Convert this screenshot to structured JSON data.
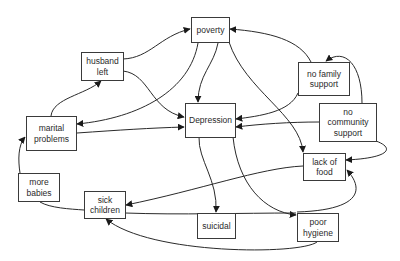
{
  "diagram": {
    "type": "causal-loop",
    "nodes": [
      {
        "id": "poverty",
        "label": "poverty"
      },
      {
        "id": "husband_left",
        "label": "husband\nleft"
      },
      {
        "id": "no_family_support",
        "label": "no family\nsupport"
      },
      {
        "id": "no_community_support",
        "label": "no\ncommunity\nsupport"
      },
      {
        "id": "marital_problems",
        "label": "marital\nproblems"
      },
      {
        "id": "depression",
        "label": "Depression"
      },
      {
        "id": "lack_of_food",
        "label": "lack of\nfood"
      },
      {
        "id": "more_babies",
        "label": "more\nbabies"
      },
      {
        "id": "sick_children",
        "label": "sick\nchildren"
      },
      {
        "id": "suicidal",
        "label": "suicidal"
      },
      {
        "id": "poor_hygiene",
        "label": "poor\nhygiene"
      }
    ],
    "edges": [
      {
        "from": "husband_left",
        "to": "poverty"
      },
      {
        "from": "husband_left",
        "to": "depression"
      },
      {
        "from": "marital_problems",
        "to": "husband_left"
      },
      {
        "from": "marital_problems",
        "to": "depression"
      },
      {
        "from": "poverty",
        "to": "marital_problems"
      },
      {
        "from": "poverty",
        "to": "depression"
      },
      {
        "from": "poverty",
        "to": "lack_of_food"
      },
      {
        "from": "no_family_support",
        "to": "poverty"
      },
      {
        "from": "no_family_support",
        "to": "depression"
      },
      {
        "from": "no_community_support",
        "to": "no_family_support"
      },
      {
        "from": "no_community_support",
        "to": "depression"
      },
      {
        "from": "no_community_support",
        "to": "lack_of_food"
      },
      {
        "from": "depression",
        "to": "suicidal"
      },
      {
        "from": "depression",
        "to": "poor_hygiene"
      },
      {
        "from": "lack_of_food",
        "to": "sick_children"
      },
      {
        "from": "sick_children",
        "to": "poor_hygiene"
      },
      {
        "from": "more_babies",
        "to": "marital_problems"
      },
      {
        "from": "more_babies",
        "to": "sick_children"
      },
      {
        "from": "poor_hygiene",
        "to": "sick_children"
      },
      {
        "from": "poor_hygiene",
        "to": "lack_of_food"
      }
    ]
  }
}
